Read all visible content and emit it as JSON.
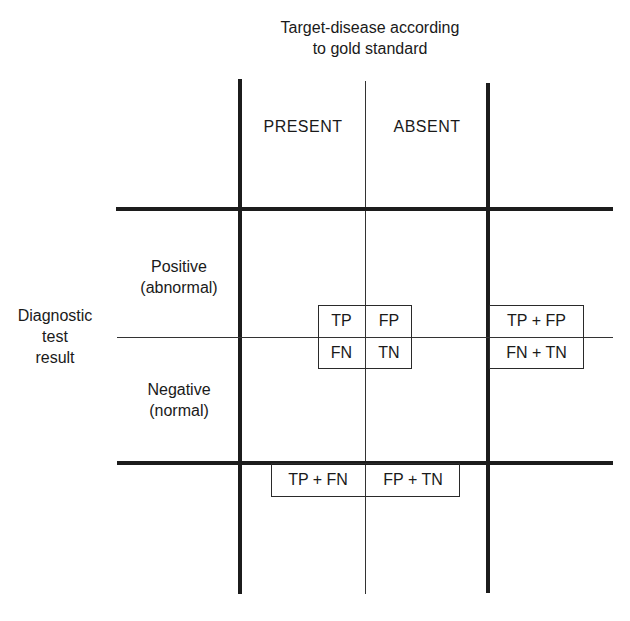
{
  "diagram": {
    "type": "2x2 contingency table",
    "column_header": {
      "title_line1": "Target-disease according",
      "title_line2": "to gold standard",
      "columns": [
        "PRESENT",
        "ABSENT"
      ]
    },
    "row_header": {
      "title_line1": "Diagnostic",
      "title_line2": "test",
      "title_line3": "result",
      "rows": [
        {
          "line1": "Positive",
          "line2": "(abnormal)"
        },
        {
          "line1": "Negative",
          "line2": "(normal)"
        }
      ]
    },
    "cells": {
      "tp": "TP",
      "fp": "FP",
      "fn": "FN",
      "tn": "TN"
    },
    "row_totals": {
      "positive": "TP + FP",
      "negative": "FN + TN"
    },
    "column_totals": {
      "present": "TP + FN",
      "absent": "FP + TN"
    }
  }
}
